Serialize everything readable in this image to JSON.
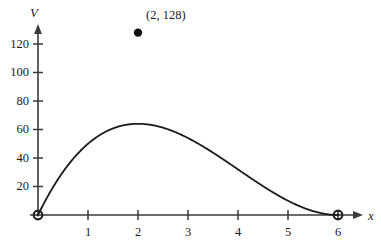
{
  "chart_data": {
    "type": "line",
    "title": "",
    "xlabel": "x",
    "ylabel": "V",
    "xlim": [
      0,
      6.4
    ],
    "ylim": [
      0,
      140
    ],
    "grid": false,
    "legend": null,
    "function_expression": "V = 2x(6 - x)^2",
    "x_ticks": [
      1,
      2,
      3,
      4,
      5,
      6
    ],
    "x_tick_labels": [
      "1",
      "2",
      "3",
      "4",
      "5",
      "6"
    ],
    "y_ticks": [
      20,
      40,
      60,
      80,
      100,
      120
    ],
    "y_tick_labels": [
      "20",
      "40",
      "60",
      "80",
      "100",
      "120"
    ],
    "annotations": [
      {
        "label": "(2, 128)",
        "x": 2,
        "y": 128,
        "marker": "filled-circle"
      }
    ],
    "endpoints": [
      {
        "label": "",
        "x": 0,
        "y": 0,
        "marker": "circle"
      },
      {
        "label": "",
        "x": 6,
        "y": 0,
        "marker": "circle"
      }
    ],
    "x": [
      0,
      0.2,
      0.4,
      0.6,
      0.8,
      1,
      1.2,
      1.4,
      1.6,
      1.8,
      2,
      2.2,
      2.4,
      2.6,
      2.8,
      3,
      3.2,
      3.4,
      3.6,
      3.8,
      4,
      4.2,
      4.4,
      4.6,
      4.8,
      5,
      5.2,
      5.4,
      5.6,
      5.8,
      6
    ],
    "values": [
      0,
      13.5,
      25.1,
      34.8,
      42.6,
      50,
      55.4,
      59.1,
      61.2,
      61.9,
      128,
      60,
      57.2,
      53.6,
      49.3,
      54,
      39.2,
      33.9,
      28.5,
      23.1,
      32,
      13.0,
      8.7,
      5.2,
      2.6,
      10,
      0.5,
      0.1,
      0.03,
      0.01,
      0
    ]
  },
  "series_exact": {
    "name": "V(x) = 2x(6-x)^2",
    "description": "Cubic curve rising from origin to maximum (2, 128) then falling to zero at x = 6"
  },
  "axes": {
    "y_axis_name": "V",
    "x_axis_name": "x",
    "y_arrow": true,
    "x_arrow": true
  },
  "colors": {
    "curve": "#1a1a1a",
    "axis": "#3a3a3a",
    "text": "#1a1a1a",
    "background": "#ffffff",
    "marker": "#111111"
  }
}
